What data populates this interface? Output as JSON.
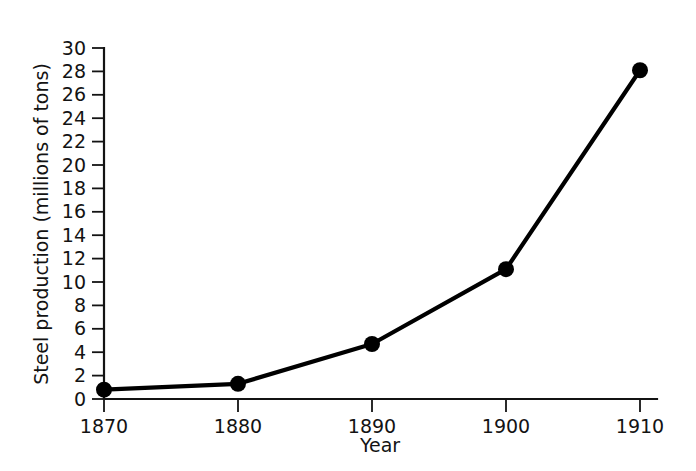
{
  "chart_data": {
    "type": "line",
    "title": "",
    "xlabel": "Year",
    "ylabel": "Steel production (millions of tons)",
    "x": [
      1870,
      1880,
      1890,
      1900,
      1910
    ],
    "values": [
      0.8,
      1.3,
      4.7,
      11.1,
      28.1
    ],
    "categories": [
      "1870",
      "1880",
      "1890",
      "1900",
      "1910"
    ],
    "xtick_labels": [
      "1870",
      "1880",
      "1890",
      "1900",
      "1910"
    ],
    "ytick_labels": [
      "0",
      "2",
      "4",
      "6",
      "8",
      "10",
      "12",
      "14",
      "16",
      "18",
      "20",
      "22",
      "24",
      "26",
      "28",
      "30"
    ],
    "ytick_values": [
      0,
      2,
      4,
      6,
      8,
      10,
      12,
      14,
      16,
      18,
      20,
      22,
      24,
      26,
      28,
      30
    ],
    "xlim": [
      1870,
      1910
    ],
    "ylim": [
      0,
      30
    ],
    "grid": false,
    "legend": false,
    "legend_position": "none",
    "series": [
      {
        "name": "Steel production",
        "values": [
          0.8,
          1.3,
          4.7,
          11.1,
          28.1
        ],
        "color": "#000000",
        "marker": "circle"
      }
    ],
    "colors": {
      "line": "#000000",
      "marker": "#000000",
      "axis": "#131313",
      "text": "#131313",
      "background": "#ffffff"
    }
  }
}
